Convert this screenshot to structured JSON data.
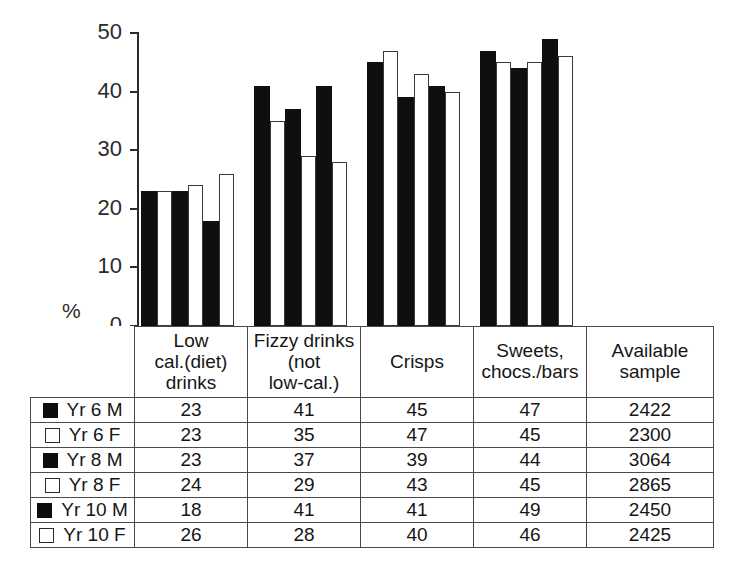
{
  "chart_data": {
    "type": "bar",
    "title": "",
    "subtitle": "",
    "xlabel": "",
    "ylabel": "%",
    "ylim": [
      0,
      50
    ],
    "yticks": [
      0,
      10,
      20,
      30,
      40,
      50
    ],
    "grid": false,
    "legend_position": "table-left-column",
    "categories": [
      "Low cal.(diet) drinks",
      "Fizzy drinks (not low-cal.)",
      "Crisps",
      "Sweets, chocs./bars"
    ],
    "series": [
      {
        "name": "Yr 6 M",
        "fill": "black",
        "values": [
          23,
          41,
          45,
          47
        ]
      },
      {
        "name": "Yr 6 F",
        "fill": "white",
        "values": [
          23,
          35,
          47,
          45
        ]
      },
      {
        "name": "Yr 8 M",
        "fill": "black",
        "values": [
          23,
          37,
          39,
          44
        ]
      },
      {
        "name": "Yr 8 F",
        "fill": "white",
        "values": [
          24,
          29,
          43,
          45
        ]
      },
      {
        "name": "Yr 10 M",
        "fill": "black",
        "values": [
          18,
          41,
          41,
          49
        ]
      },
      {
        "name": "Yr 10 F",
        "fill": "white",
        "values": [
          26,
          28,
          40,
          46
        ]
      }
    ],
    "available_sample": [
      2422,
      2300,
      3064,
      2865,
      2450,
      2425
    ]
  },
  "axis": {
    "percent_symbol": "%",
    "tick_labels": [
      "50",
      "40",
      "30",
      "20",
      "10",
      "0"
    ]
  },
  "table": {
    "headers": [
      "",
      "Low cal.(diet) drinks",
      "Fizzy drinks (not low-cal.)",
      "Crisps",
      "Sweets, chocs./bars",
      "Available sample"
    ],
    "header_lines": [
      [
        ""
      ],
      [
        "Low",
        "cal.(diet)",
        "drinks"
      ],
      [
        "Fizzy drinks",
        "(not",
        "low-cal.)"
      ],
      [
        "Crisps"
      ],
      [
        "Sweets,",
        "chocs./bars"
      ],
      [
        "Available",
        "sample"
      ]
    ],
    "rows": [
      {
        "label": "Yr 6 M",
        "swatch": "filled-square-icon",
        "values": [
          "23",
          "41",
          "45",
          "47",
          "2422"
        ]
      },
      {
        "label": "Yr 6 F",
        "swatch": "hollow-square-icon",
        "values": [
          "23",
          "35",
          "47",
          "45",
          "2300"
        ]
      },
      {
        "label": "Yr 8 M",
        "swatch": "filled-square-icon",
        "values": [
          "23",
          "37",
          "39",
          "44",
          "3064"
        ]
      },
      {
        "label": "Yr 8 F",
        "swatch": "hollow-square-icon",
        "values": [
          "24",
          "29",
          "43",
          "45",
          "2865"
        ]
      },
      {
        "label": "Yr 10 M",
        "swatch": "filled-square-icon",
        "values": [
          "18",
          "41",
          "41",
          "49",
          "2450"
        ]
      },
      {
        "label": "Yr 10 F",
        "swatch": "hollow-square-icon",
        "values": [
          "26",
          "28",
          "40",
          "46",
          "2425"
        ]
      }
    ]
  },
  "colors": {
    "bar_male": "#100f0f",
    "bar_female": "#ffffff",
    "outline": "#3a3a3a",
    "axis": "#2b2b2b",
    "text": "#161616",
    "background": "#ffffff"
  }
}
